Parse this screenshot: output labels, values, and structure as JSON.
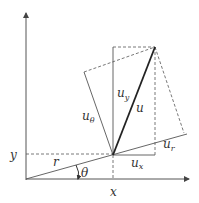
{
  "diagram": {
    "labels": {
      "y_axis": "y",
      "x_axis": "x",
      "r": "r",
      "theta": "θ",
      "u": "u",
      "u_y": "u",
      "u_y_sub": "y",
      "u_x": "u",
      "u_x_sub": "x",
      "u_r": "u",
      "u_r_sub": "r",
      "u_theta": "u",
      "u_theta_sub": "θ"
    },
    "colors": {
      "line": "#555555",
      "vector": "#222222",
      "background": "#ffffff"
    }
  }
}
